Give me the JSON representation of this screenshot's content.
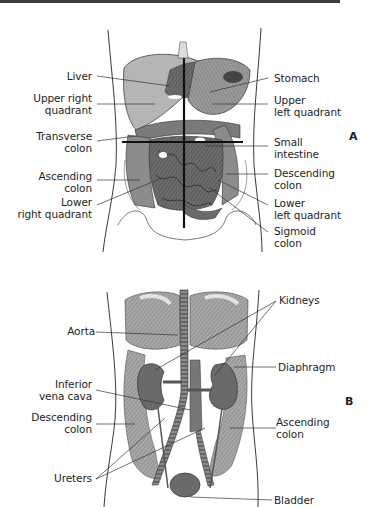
{
  "figure_a": {
    "panel_letter": "A",
    "left_labels": [
      {
        "lines": [
          "Liver"
        ]
      },
      {
        "lines": [
          "Upper right",
          "quadrant"
        ]
      },
      {
        "lines": [
          "Transverse",
          "colon"
        ]
      },
      {
        "lines": [
          "Ascending",
          "colon"
        ]
      },
      {
        "lines": [
          "Lower",
          "right quadrant"
        ]
      }
    ],
    "right_labels": [
      {
        "lines": [
          "Stomach"
        ]
      },
      {
        "lines": [
          "Upper",
          "left quadrant"
        ]
      },
      {
        "lines": [
          "Small",
          "intestine"
        ]
      },
      {
        "lines": [
          "Descending",
          "colon"
        ]
      },
      {
        "lines": [
          "Lower",
          "left quadrant"
        ]
      },
      {
        "lines": [
          "Sigmoid",
          "colon"
        ]
      }
    ]
  },
  "figure_b": {
    "panel_letter": "B",
    "left_labels": [
      {
        "lines": [
          "Aorta"
        ]
      },
      {
        "lines": [
          "Inferior",
          "vena cava"
        ]
      },
      {
        "lines": [
          "Descending",
          "colon"
        ]
      },
      {
        "lines": [
          "Ureters"
        ]
      }
    ],
    "right_labels": [
      {
        "lines": [
          "Kidneys"
        ]
      },
      {
        "lines": [
          "Diaphragm"
        ]
      },
      {
        "lines": [
          "Ascending",
          "colon"
        ]
      },
      {
        "lines": [
          "Bladder"
        ]
      }
    ]
  },
  "colors": {
    "ink": "#1e1e1e",
    "organ_dark": "#5a5a5a",
    "organ_mid": "#8a8a8a",
    "organ_light": "#c8c8c8"
  }
}
